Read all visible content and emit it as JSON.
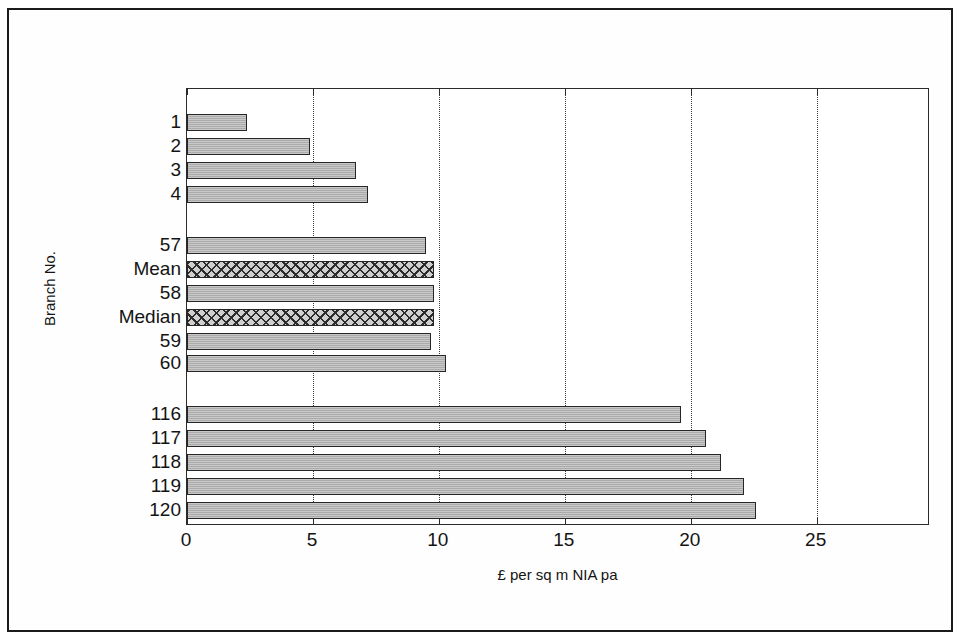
{
  "chart_data": {
    "type": "bar",
    "orientation": "horizontal",
    "title": "",
    "xlabel": "£ per sq m NIA pa",
    "ylabel": "Branch No.",
    "xlim": [
      0,
      29.5
    ],
    "xticks": [
      0,
      5,
      10,
      15,
      20,
      25
    ],
    "xticklabels": [
      "0",
      "5",
      "10",
      "15",
      "20",
      "25"
    ],
    "grid": "vertical-dotted",
    "legend": "none",
    "categories": [
      "1",
      "2",
      "3",
      "4",
      "57",
      "Mean",
      "58",
      "Median",
      "59",
      "60",
      "116",
      "117",
      "118",
      "119",
      "120"
    ],
    "values": [
      2.4,
      4.9,
      6.7,
      7.2,
      9.5,
      9.8,
      9.8,
      9.8,
      9.7,
      10.3,
      19.6,
      20.6,
      21.2,
      22.1,
      22.6
    ],
    "bars": [
      {
        "label": "1",
        "value": 2.4,
        "style": "solid",
        "group": "low"
      },
      {
        "label": "2",
        "value": 4.9,
        "style": "solid",
        "group": "low"
      },
      {
        "label": "3",
        "value": 6.7,
        "style": "solid",
        "group": "low"
      },
      {
        "label": "4",
        "value": 7.2,
        "style": "solid",
        "group": "low"
      },
      {
        "label": "57",
        "value": 9.5,
        "style": "solid",
        "group": "mid"
      },
      {
        "label": "Mean",
        "value": 9.8,
        "style": "hatch",
        "group": "mid"
      },
      {
        "label": "58",
        "value": 9.8,
        "style": "solid",
        "group": "mid"
      },
      {
        "label": "Median",
        "value": 9.8,
        "style": "hatch",
        "group": "mid"
      },
      {
        "label": "59",
        "value": 9.7,
        "style": "solid",
        "group": "mid"
      },
      {
        "label": "60",
        "value": 10.3,
        "style": "solid",
        "group": "mid"
      },
      {
        "label": "116",
        "value": 19.6,
        "style": "solid",
        "group": "high"
      },
      {
        "label": "117",
        "value": 20.6,
        "style": "solid",
        "group": "high"
      },
      {
        "label": "118",
        "value": 21.2,
        "style": "solid",
        "group": "high"
      },
      {
        "label": "119",
        "value": 22.1,
        "style": "solid",
        "group": "high"
      },
      {
        "label": "120",
        "value": 22.6,
        "style": "solid",
        "group": "high"
      }
    ],
    "colors": {
      "bar_fill": "#b2b2b2",
      "bar_border": "#262626",
      "hatch_fill": "#cfcfcf",
      "axis": "#2a2a2a",
      "grid": "#3a3a3a",
      "text": "#141414",
      "background": "#ffffff"
    }
  }
}
